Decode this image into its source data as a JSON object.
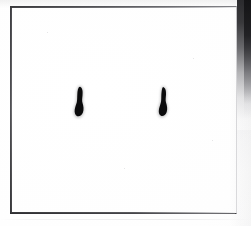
{
  "image": {
    "kind": "scanned-plate-photograph",
    "width": 251,
    "height": 226,
    "alt_text": "Scanned white plate with a thin drawn rectangular border and two dark elongated spots",
    "background_color": "#fdfdfd"
  },
  "frame": {
    "label": "plate-border",
    "left": 10,
    "top": 6,
    "width": 227,
    "height": 208,
    "line_color": "#3f3f43",
    "line_color_faint": "#d8d8da",
    "top_edge_label": "frame-top-rule",
    "right_edge_label": "frame-right-rule"
  },
  "edge_shadow": {
    "label": "right-edge-shadow-band",
    "color": "#232326",
    "x": 237,
    "top": 0,
    "width": 14,
    "height": 140
  },
  "spots": [
    {
      "id": "spot-left",
      "label": "dark-spot-left",
      "center_x": 80,
      "center_y": 103,
      "width": 14,
      "height": 32,
      "color": "#0b0b0c",
      "shape": "elongated-teardrop"
    },
    {
      "id": "spot-right",
      "label": "dark-spot-right",
      "center_x": 164,
      "center_y": 103,
      "width": 14,
      "height": 32,
      "color": "#0b0b0c",
      "shape": "elongated-teardrop"
    }
  ],
  "chart_data": {
    "type": "scatter",
    "title": "",
    "xlabel": "",
    "ylabel": "",
    "xlim": [
      0,
      251
    ],
    "ylim": [
      226,
      0
    ],
    "grid": false,
    "legend": null,
    "series": [
      {
        "name": "dark spots",
        "x": [
          80,
          164
        ],
        "y": [
          103,
          103
        ],
        "sizes": [
          32,
          32
        ],
        "color": "#0b0b0c"
      }
    ],
    "annotations": []
  }
}
